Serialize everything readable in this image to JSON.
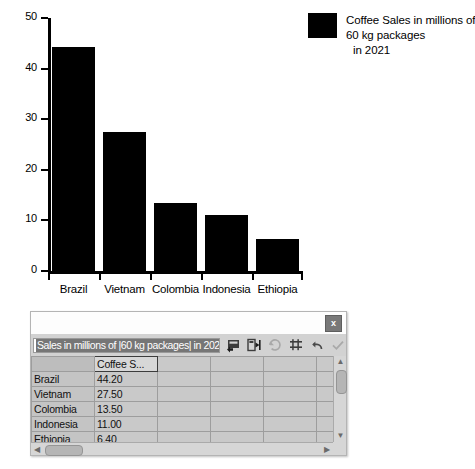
{
  "chart_data": {
    "type": "bar",
    "title": "",
    "categories": [
      "Brazil",
      "Vietnam",
      "Colombia",
      "Indonesia",
      "Ethiopia"
    ],
    "values": [
      44.2,
      27.5,
      13.5,
      11.0,
      6.4
    ],
    "series": [
      {
        "name": "Coffee Sales in millions of 60 kg packages in 2021",
        "values": [
          44.2,
          27.5,
          13.5,
          11.0,
          6.4
        ],
        "color": "#000000"
      }
    ],
    "xlabel": "",
    "ylabel": "",
    "ylim": [
      0,
      50
    ],
    "yticks": [
      0,
      10,
      20,
      30,
      40,
      50
    ],
    "ytick_labels": [
      "0",
      "10",
      "20",
      "30",
      "40",
      "50"
    ],
    "grid": false,
    "legend_position": "right",
    "bar_color": "#000000"
  },
  "legend": {
    "swatch_color": "#000000",
    "line1": "Coffee Sales in millions of",
    "line2": "60 kg packages",
    "line3": "in 2021"
  },
  "table_window": {
    "close_label": "x",
    "range_field": {
      "value": "Sales in millions of |60 kg packages| in 2021",
      "selected": true
    },
    "toolbar_icons": [
      {
        "name": "insert-row-icon",
        "enabled": true
      },
      {
        "name": "insert-column-icon",
        "enabled": true
      },
      {
        "name": "delete-row-icon",
        "enabled": false
      },
      {
        "name": "delete-column-icon",
        "enabled": true
      },
      {
        "name": "undo-icon",
        "enabled": true
      },
      {
        "name": "confirm-check-icon",
        "enabled": false
      }
    ],
    "grid": {
      "column_headers": [
        "",
        "Coffee S...",
        "",
        "",
        "",
        ""
      ],
      "selected_header": "Coffee S...",
      "rows": [
        {
          "label": "Brazil",
          "value": "44.20"
        },
        {
          "label": "Vietnam",
          "value": "27.50"
        },
        {
          "label": "Colombia",
          "value": "13.50"
        },
        {
          "label": "Indonesia",
          "value": "11.00"
        },
        {
          "label": "Ethiopia",
          "value": "6.40"
        }
      ]
    },
    "scrollbar": {
      "up_arrow": "▲",
      "down_arrow": "▼",
      "left_arrow": "◀",
      "right_arrow": "▶"
    }
  }
}
